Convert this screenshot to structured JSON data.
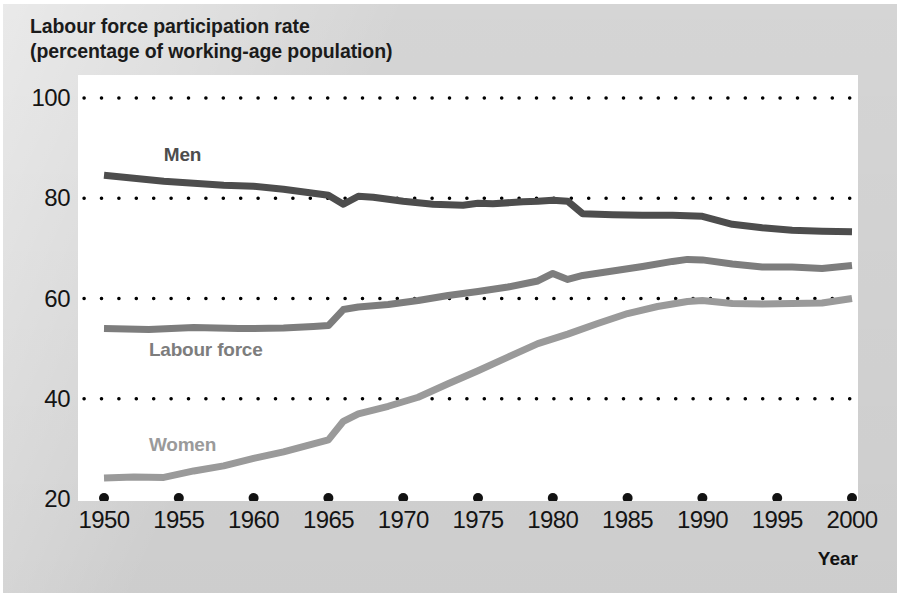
{
  "chart_data": {
    "type": "line",
    "title": "Labour force participation rate",
    "subtitle": "(percentage of working-age population)",
    "xlabel": "Year",
    "ylabel": "",
    "xlim": [
      1950,
      2000
    ],
    "ylim": [
      20,
      100
    ],
    "grid": "horizontal-dotted",
    "yticks": [
      20,
      40,
      60,
      80,
      100
    ],
    "ytick_labels": [
      "20",
      "40",
      "60",
      "80",
      "100"
    ],
    "xticks": [
      1950,
      1955,
      1960,
      1965,
      1970,
      1975,
      1980,
      1985,
      1990,
      1995,
      2000
    ],
    "xtick_labels": [
      "1950",
      "1955",
      "1960",
      "1965",
      "1970",
      "1975",
      "1980",
      "1985",
      "1990",
      "1995",
      "2000"
    ],
    "legend_position": "inline-annotations",
    "series": [
      {
        "name": "Men",
        "color": "#4d4d4d",
        "label_x": 1954,
        "label_y": 88.5,
        "x": [
          1950,
          1952,
          1954,
          1956,
          1958,
          1960,
          1962,
          1964,
          1965,
          1966,
          1967,
          1968,
          1970,
          1972,
          1974,
          1975,
          1976,
          1978,
          1979,
          1980,
          1981,
          1982,
          1984,
          1986,
          1988,
          1990,
          1992,
          1994,
          1996,
          1998,
          2000
        ],
        "values": [
          84.6,
          84.0,
          83.4,
          83.0,
          82.6,
          82.4,
          81.8,
          81.0,
          80.6,
          78.8,
          80.4,
          80.2,
          79.4,
          78.8,
          78.6,
          79.0,
          78.9,
          79.3,
          79.4,
          79.6,
          79.4,
          76.9,
          76.7,
          76.6,
          76.6,
          76.4,
          74.8,
          74.1,
          73.6,
          73.4,
          73.3
        ]
      },
      {
        "name": "Labour force",
        "color": "#7d7d7d",
        "label_x": 1953,
        "label_y": 49.5,
        "x": [
          1950,
          1953,
          1956,
          1959,
          1962,
          1964,
          1965,
          1966,
          1967,
          1969,
          1971,
          1973,
          1975,
          1977,
          1979,
          1980,
          1981,
          1982,
          1984,
          1986,
          1988,
          1989,
          1990,
          1992,
          1994,
          1996,
          1998,
          2000
        ],
        "values": [
          54.0,
          53.8,
          54.2,
          54.0,
          54.1,
          54.4,
          54.6,
          57.8,
          58.3,
          58.8,
          59.6,
          60.6,
          61.4,
          62.3,
          63.5,
          65.0,
          63.8,
          64.6,
          65.5,
          66.4,
          67.4,
          67.8,
          67.7,
          66.9,
          66.3,
          66.3,
          66.0,
          66.6
        ]
      },
      {
        "name": "Women",
        "color": "#9a9a9a",
        "label_x": 1953,
        "label_y": 30.5,
        "x": [
          1950,
          1952,
          1954,
          1956,
          1958,
          1960,
          1962,
          1964,
          1965,
          1966,
          1967,
          1969,
          1971,
          1973,
          1975,
          1977,
          1979,
          1981,
          1983,
          1985,
          1987,
          1989,
          1990,
          1992,
          1994,
          1996,
          1998,
          2000
        ],
        "values": [
          24.2,
          24.4,
          24.3,
          25.6,
          26.6,
          28.1,
          29.4,
          31.0,
          31.8,
          35.5,
          37.0,
          38.5,
          40.3,
          43.0,
          45.6,
          48.3,
          51.0,
          52.9,
          55.0,
          57.0,
          58.4,
          59.4,
          59.6,
          59.0,
          58.9,
          59.0,
          59.1,
          60.0
        ]
      }
    ]
  },
  "axis": {
    "year_label": "Year"
  }
}
